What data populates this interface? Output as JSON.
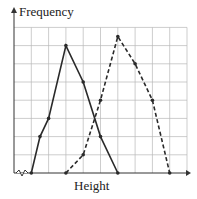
{
  "chart_data": {
    "type": "line",
    "title": "",
    "xlabel": "Height",
    "ylabel": "Frequency",
    "grid": true,
    "axis_break_x": true,
    "x_gridlines": 10,
    "y_gridlines": 8,
    "series": [
      {
        "name": "solid",
        "style": "solid",
        "points": [
          [
            1,
            0
          ],
          [
            1.5,
            2
          ],
          [
            2,
            3
          ],
          [
            3,
            7
          ],
          [
            4,
            5
          ],
          [
            5,
            2
          ],
          [
            6,
            0
          ]
        ]
      },
      {
        "name": "dashed",
        "style": "dashed",
        "points": [
          [
            3,
            0
          ],
          [
            4,
            1
          ],
          [
            5,
            4
          ],
          [
            6,
            7.5
          ],
          [
            7,
            6
          ],
          [
            8,
            4
          ],
          [
            9,
            0
          ]
        ]
      }
    ]
  },
  "colors": {
    "grid": "#b8b8b8",
    "line": "#2a2a2a",
    "axis": "#333333"
  }
}
